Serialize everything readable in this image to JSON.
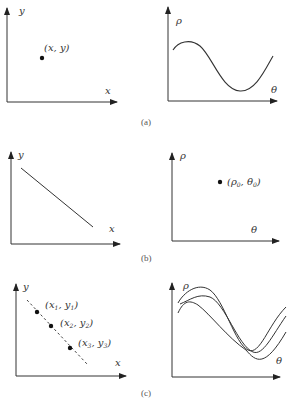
{
  "figure": {
    "panels": [
      {
        "id": "a",
        "caption": "(a)",
        "left": {
          "x_axis_label": "x",
          "y_axis_label": "y",
          "point_label": "(x, y)"
        },
        "right": {
          "x_axis_label": "θ",
          "y_axis_label": "ρ",
          "description": "single sinusoidal curve"
        }
      },
      {
        "id": "b",
        "caption": "(b)",
        "left": {
          "x_axis_label": "x",
          "y_axis_label": "y",
          "description": "straight line with negative slope"
        },
        "right": {
          "x_axis_label": "θ",
          "y_axis_label": "ρ",
          "point_label_main": "(ρ",
          "point_label_sub1": "0",
          "point_label_mid": ", θ",
          "point_label_sub2": "0",
          "point_label_end": ")"
        }
      },
      {
        "id": "c",
        "caption": "(c)",
        "left": {
          "x_axis_label": "x",
          "y_axis_label": "y",
          "points": [
            {
              "pre": "(x",
              "sub1": "1",
              "mid": ", y",
              "sub2": "1",
              "end": ")"
            },
            {
              "pre": "(x",
              "sub1": "2",
              "mid": ", y",
              "sub2": "2",
              "end": ")"
            },
            {
              "pre": "(x",
              "sub1": "3",
              "mid": ", y",
              "sub2": "3",
              "end": ")"
            }
          ],
          "description": "three collinear points on a dashed line"
        },
        "right": {
          "x_axis_label": "θ",
          "y_axis_label": "ρ",
          "description": "three sinusoidal curves intersecting at common points"
        }
      }
    ],
    "colors": {
      "stroke": "#333333",
      "text": "#333333"
    }
  }
}
